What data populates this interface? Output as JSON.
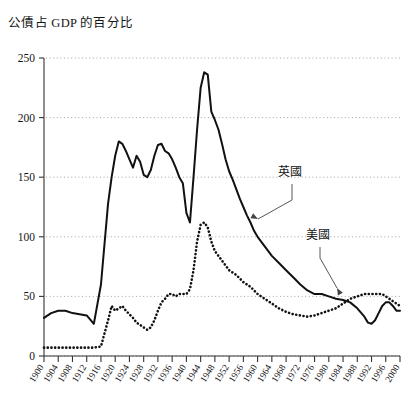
{
  "chart_data": {
    "type": "line",
    "title": "公債占 GDP 的百分比",
    "xlabel": "",
    "ylabel": "",
    "xlim": [
      1900,
      2000
    ],
    "ylim": [
      0,
      250
    ],
    "yticks": [
      0,
      50,
      100,
      150,
      200,
      250
    ],
    "xticks": [
      1900,
      1904,
      1908,
      1912,
      1916,
      1920,
      1924,
      1928,
      1932,
      1936,
      1940,
      1944,
      1948,
      1952,
      1956,
      1960,
      1964,
      1968,
      1972,
      1976,
      1980,
      1984,
      1988,
      1992,
      1996,
      2000
    ],
    "grid": "horizontal-dotted",
    "legend": "annotations",
    "annotations": [
      {
        "text": "英國",
        "points_to": "uk-solid-line",
        "x": 1968,
        "y": 168
      },
      {
        "text": "美國",
        "points_to": "us-dotted-line",
        "x": 1980,
        "y": 110
      }
    ],
    "series": [
      {
        "name": "英國",
        "style": "solid",
        "color": "#111111",
        "x": [
          1900,
          1902,
          1904,
          1906,
          1908,
          1910,
          1912,
          1914,
          1916,
          1918,
          1919,
          1920,
          1921,
          1922,
          1923,
          1924,
          1925,
          1926,
          1927,
          1928,
          1929,
          1930,
          1931,
          1932,
          1933,
          1934,
          1935,
          1936,
          1937,
          1938,
          1939,
          1940,
          1941,
          1942,
          1943,
          1944,
          1945,
          1946,
          1947,
          1948,
          1949,
          1950,
          1951,
          1952,
          1953,
          1954,
          1955,
          1956,
          1957,
          1958,
          1959,
          1960,
          1962,
          1964,
          1966,
          1968,
          1970,
          1972,
          1974,
          1976,
          1978,
          1980,
          1982,
          1984,
          1986,
          1988,
          1990,
          1991,
          1992,
          1993,
          1994,
          1995,
          1996,
          1997,
          1998,
          1999,
          2000
        ],
        "y": [
          32,
          36,
          38,
          38,
          36,
          35,
          34,
          27,
          60,
          128,
          150,
          168,
          180,
          178,
          172,
          165,
          158,
          168,
          163,
          152,
          150,
          156,
          168,
          177,
          178,
          172,
          170,
          165,
          158,
          150,
          145,
          120,
          112,
          150,
          190,
          225,
          238,
          236,
          205,
          198,
          190,
          178,
          165,
          155,
          148,
          140,
          132,
          125,
          118,
          112,
          105,
          100,
          92,
          84,
          78,
          72,
          66,
          60,
          55,
          52,
          52,
          50,
          48,
          47,
          45,
          40,
          33,
          28,
          27,
          30,
          36,
          42,
          45,
          45,
          42,
          38,
          38
        ]
      },
      {
        "name": "美國",
        "style": "dotted",
        "color": "#111111",
        "x": [
          1900,
          1902,
          1904,
          1906,
          1908,
          1910,
          1912,
          1914,
          1916,
          1918,
          1919,
          1920,
          1921,
          1922,
          1923,
          1924,
          1925,
          1926,
          1927,
          1928,
          1929,
          1930,
          1931,
          1932,
          1933,
          1934,
          1935,
          1936,
          1937,
          1938,
          1939,
          1940,
          1941,
          1942,
          1943,
          1944,
          1945,
          1946,
          1947,
          1948,
          1949,
          1950,
          1952,
          1954,
          1956,
          1958,
          1960,
          1962,
          1964,
          1966,
          1968,
          1970,
          1972,
          1974,
          1976,
          1978,
          1980,
          1982,
          1984,
          1986,
          1988,
          1990,
          1992,
          1993,
          1994,
          1995,
          1996,
          1997,
          1998,
          1999,
          2000
        ],
        "y": [
          7,
          7,
          7,
          7,
          7,
          7,
          7,
          7,
          8,
          30,
          42,
          38,
          40,
          42,
          38,
          35,
          32,
          28,
          26,
          24,
          22,
          24,
          30,
          38,
          45,
          48,
          52,
          52,
          50,
          52,
          52,
          52,
          56,
          72,
          96,
          110,
          112,
          108,
          96,
          88,
          84,
          80,
          72,
          68,
          62,
          58,
          52,
          48,
          44,
          40,
          37,
          35,
          34,
          33,
          34,
          36,
          38,
          40,
          44,
          48,
          50,
          52,
          52,
          52,
          52,
          52,
          50,
          48,
          46,
          44,
          42
        ]
      }
    ]
  }
}
